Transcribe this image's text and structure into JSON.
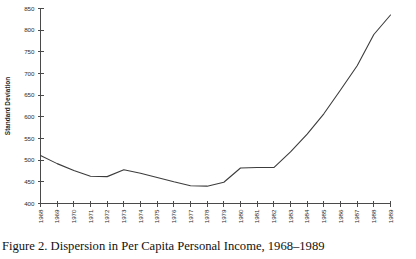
{
  "figure": {
    "caption": "Figure 2.  Dispersion in Per Capita Personal Income, 1968–1989"
  },
  "chart_data": {
    "type": "line",
    "title": "",
    "xlabel": "",
    "ylabel": "Standard Deviation",
    "grid": false,
    "legend": false,
    "legend_position": "none",
    "line_color": "#3c3c3c",
    "axis_color": "#4a4a4a",
    "background_color": "#ffffff",
    "xlim": [
      1968,
      1989
    ],
    "ylim": [
      400,
      850
    ],
    "ytick_step": 50,
    "x": [
      1968,
      1969,
      1970,
      1971,
      1972,
      1973,
      1974,
      1975,
      1976,
      1977,
      1978,
      1979,
      1980,
      1981,
      1982,
      1983,
      1984,
      1985,
      1986,
      1987,
      1988,
      1989
    ],
    "categories": [
      "1968",
      "1969",
      "1970",
      "1971",
      "1972",
      "1973",
      "1974",
      "1975",
      "1976",
      "1977",
      "1978",
      "1979",
      "1980",
      "1981",
      "1982",
      "1983",
      "1984",
      "1985",
      "1986",
      "1987",
      "1988",
      "1989"
    ],
    "values": [
      511,
      492,
      476,
      463,
      462,
      478,
      470,
      460,
      450,
      441,
      440,
      449,
      482,
      483,
      483,
      519,
      560,
      607,
      662,
      718,
      790,
      835
    ],
    "yticks": [
      400,
      450,
      500,
      550,
      600,
      650,
      700,
      750,
      800,
      850
    ],
    "ytick_labels": [
      "400",
      "450",
      "500",
      "550",
      "600",
      "650",
      "700",
      "750",
      "800",
      "850"
    ],
    "xticks": [
      1968,
      1969,
      1970,
      1971,
      1972,
      1973,
      1974,
      1975,
      1976,
      1977,
      1978,
      1979,
      1980,
      1981,
      1982,
      1983,
      1984,
      1985,
      1986,
      1987,
      1988,
      1989
    ],
    "xtick_labels": [
      "1968",
      "1969",
      "1970",
      "1971",
      "1972",
      "1973",
      "1974",
      "1975",
      "1976",
      "1977",
      "1978",
      "1979",
      "1980",
      "1981",
      "1982",
      "1983",
      "1984",
      "1985",
      "1986",
      "1987",
      "1988",
      "1989"
    ],
    "series": [
      {
        "name": "Standard Deviation of Per Capita Personal Income",
        "values": [
          511,
          492,
          476,
          463,
          462,
          478,
          470,
          460,
          450,
          441,
          440,
          449,
          482,
          483,
          483,
          519,
          560,
          607,
          662,
          718,
          790,
          835
        ]
      }
    ]
  }
}
